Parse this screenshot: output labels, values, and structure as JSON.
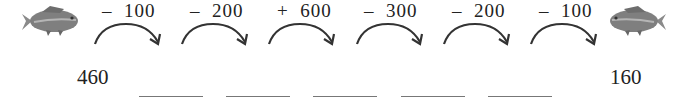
{
  "puzzle": {
    "start_value": "460",
    "end_value": "160",
    "steps": [
      {
        "label": "–  100"
      },
      {
        "label": "–  200"
      },
      {
        "label": "+  600"
      },
      {
        "label": "–  300"
      },
      {
        "label": "–  200"
      },
      {
        "label": "–  100"
      }
    ],
    "blanks": [
      "",
      "",
      "",
      "",
      ""
    ]
  },
  "icons": {
    "left": "fish-icon",
    "right": "fish-icon"
  },
  "colors": {
    "text": "#222222",
    "arrow": "#333333",
    "fish": "#7a7a7a",
    "blank_line": "#777777"
  }
}
